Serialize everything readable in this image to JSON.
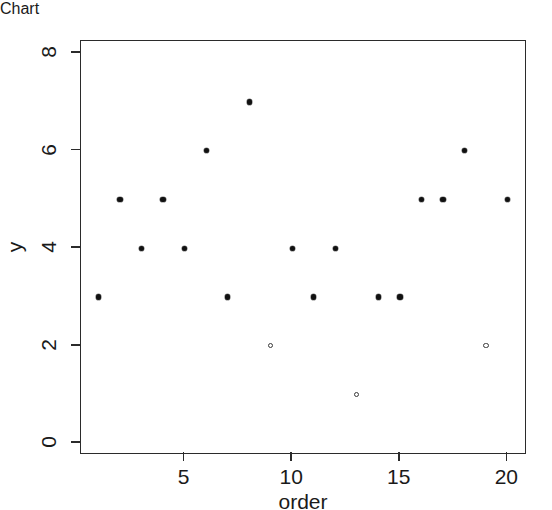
{
  "chart_data": {
    "type": "scatter",
    "title": "",
    "xlabel": "order",
    "ylabel": "y",
    "x": [
      1,
      2,
      3,
      4,
      5,
      6,
      7,
      8,
      9,
      10,
      11,
      12,
      13,
      14,
      15,
      16,
      17,
      18,
      19,
      20
    ],
    "values": [
      3,
      5,
      4,
      5,
      4,
      6,
      3,
      7,
      2,
      4,
      3,
      4,
      1,
      3,
      3,
      5,
      5,
      6,
      2,
      5
    ],
    "points": [
      {
        "x": 1,
        "y": 3
      },
      {
        "x": 2,
        "y": 5
      },
      {
        "x": 3,
        "y": 4
      },
      {
        "x": 4,
        "y": 5
      },
      {
        "x": 5,
        "y": 4
      },
      {
        "x": 6,
        "y": 6
      },
      {
        "x": 7,
        "y": 3
      },
      {
        "x": 8,
        "y": 7
      },
      {
        "x": 9,
        "y": 2
      },
      {
        "x": 10,
        "y": 4
      },
      {
        "x": 11,
        "y": 3
      },
      {
        "x": 12,
        "y": 4
      },
      {
        "x": 13,
        "y": 1
      },
      {
        "x": 14,
        "y": 3
      },
      {
        "x": 15,
        "y": 3
      },
      {
        "x": 16,
        "y": 5
      },
      {
        "x": 17,
        "y": 5
      },
      {
        "x": 18,
        "y": 6
      },
      {
        "x": 19,
        "y": 2
      },
      {
        "x": 20,
        "y": 5
      }
    ],
    "xlim": [
      0.18,
      20.82
    ],
    "ylim": [
      -0.2,
      8.25
    ],
    "xticks": [
      5,
      10,
      15,
      20
    ],
    "yticks": [
      0,
      2,
      4,
      6,
      8
    ],
    "xticklabels": [
      "5",
      "10",
      "15",
      "20"
    ],
    "yticklabels": [
      "0",
      "2",
      "4",
      "6",
      "8"
    ],
    "grid": false,
    "legend": null,
    "marker": "filled-circle",
    "marker_color": "#111111",
    "frame_color": "#2b2b2b",
    "background": "#ffffff"
  }
}
